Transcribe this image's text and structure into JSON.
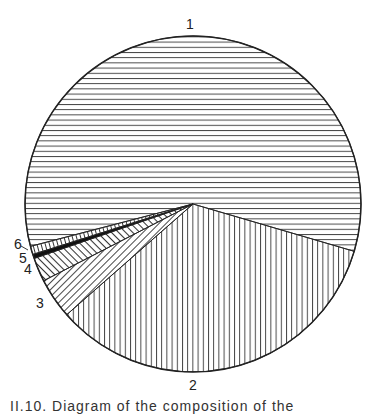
{
  "chart_data": {
    "type": "pie",
    "title": "",
    "center": [
      193,
      204
    ],
    "radius": 168,
    "start_angle_deg": 165.4,
    "direction": "clockwise",
    "slices": [
      {
        "label": "1",
        "value": 58.6,
        "pattern": "horizontal"
      },
      {
        "label": "2",
        "value": 34.0,
        "pattern": "vertical"
      },
      {
        "label": "3",
        "value": 3.9,
        "pattern": "diagonal-up"
      },
      {
        "label": "4",
        "value": 2.3,
        "pattern": "diagonal-down"
      },
      {
        "label": "5",
        "value": 0.4,
        "pattern": "solid"
      },
      {
        "label": "6",
        "value": 0.8,
        "pattern": "ticks"
      }
    ],
    "legend": "none (numeric labels outside slices)"
  },
  "labels": {
    "l1": "1",
    "l2": "2",
    "l3": "3",
    "l4": "4",
    "l5": "5",
    "l6": "6"
  },
  "caption": "II.10. Diagram of the composition of the"
}
